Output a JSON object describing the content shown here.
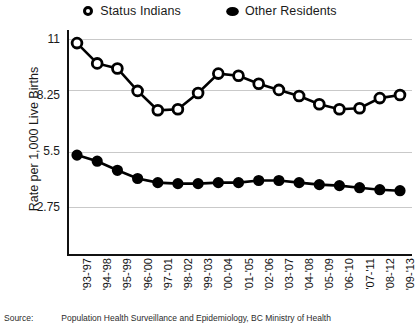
{
  "legend": {
    "entries": [
      {
        "label": "Status Indians",
        "marker": "open-circle-icon",
        "color": "#000000"
      },
      {
        "label": "Other Residents",
        "marker": "filled-circle-icon",
        "color": "#000000"
      }
    ]
  },
  "axis": {
    "ylabel": "Rate per 1,000 Live Births",
    "yticks": [
      "11",
      "8.25",
      "5.5",
      "2.75"
    ]
  },
  "source": {
    "label": "Source:",
    "text": "Population Health Surveillance and Epidemiology, BC Ministry of Health"
  },
  "chart_data": {
    "type": "line",
    "title": "",
    "xlabel": "",
    "ylabel": "Rate per 1,000 Live Births",
    "ylim": [
      0,
      11
    ],
    "yticks": [
      2.75,
      5.5,
      8.25,
      11
    ],
    "grid": true,
    "legend_position": "top-center",
    "categories": [
      "'93-'97",
      "'94-'98",
      "'95-'99",
      "'96-'00",
      "'97-'01",
      "'98-'02",
      "'99-'03",
      "'00-'04",
      "'01-'05",
      "'02-'06",
      "'03-'07",
      "'04-'08",
      "'05-'09",
      "'06-'10",
      "'07-'11",
      "'08-'12",
      "'09-'13"
    ],
    "series": [
      {
        "name": "Status Indians",
        "marker": "open-circle",
        "values": [
          10.8,
          9.8,
          9.55,
          8.45,
          7.5,
          7.55,
          8.35,
          9.3,
          9.2,
          8.8,
          8.5,
          8.2,
          7.8,
          7.55,
          7.6,
          8.1,
          8.25
        ]
      },
      {
        "name": "Other Residents",
        "marker": "filled-circle",
        "values": [
          5.3,
          5.0,
          4.55,
          4.15,
          3.95,
          3.9,
          3.9,
          3.95,
          3.95,
          4.05,
          4.05,
          3.95,
          3.85,
          3.8,
          3.7,
          3.6,
          3.55
        ]
      }
    ]
  }
}
